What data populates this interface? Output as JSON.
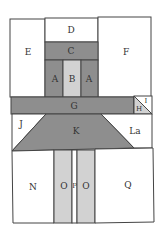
{
  "diagram": {
    "title": "",
    "colors": {
      "dark": "#8e8e8e",
      "light": "#d2d2d2",
      "white": "#ffffff",
      "border": "#444444"
    },
    "pieces": {
      "A_left": "A",
      "B": "B",
      "A_right": "A",
      "C": "C",
      "D": "D",
      "E": "E",
      "F": "F",
      "G": "G",
      "H": "H",
      "I": "I",
      "J": "J",
      "K": "K",
      "La": "La",
      "N": "N",
      "O_left": "O",
      "P": "P",
      "O_right": "O",
      "Q": "Q"
    }
  }
}
